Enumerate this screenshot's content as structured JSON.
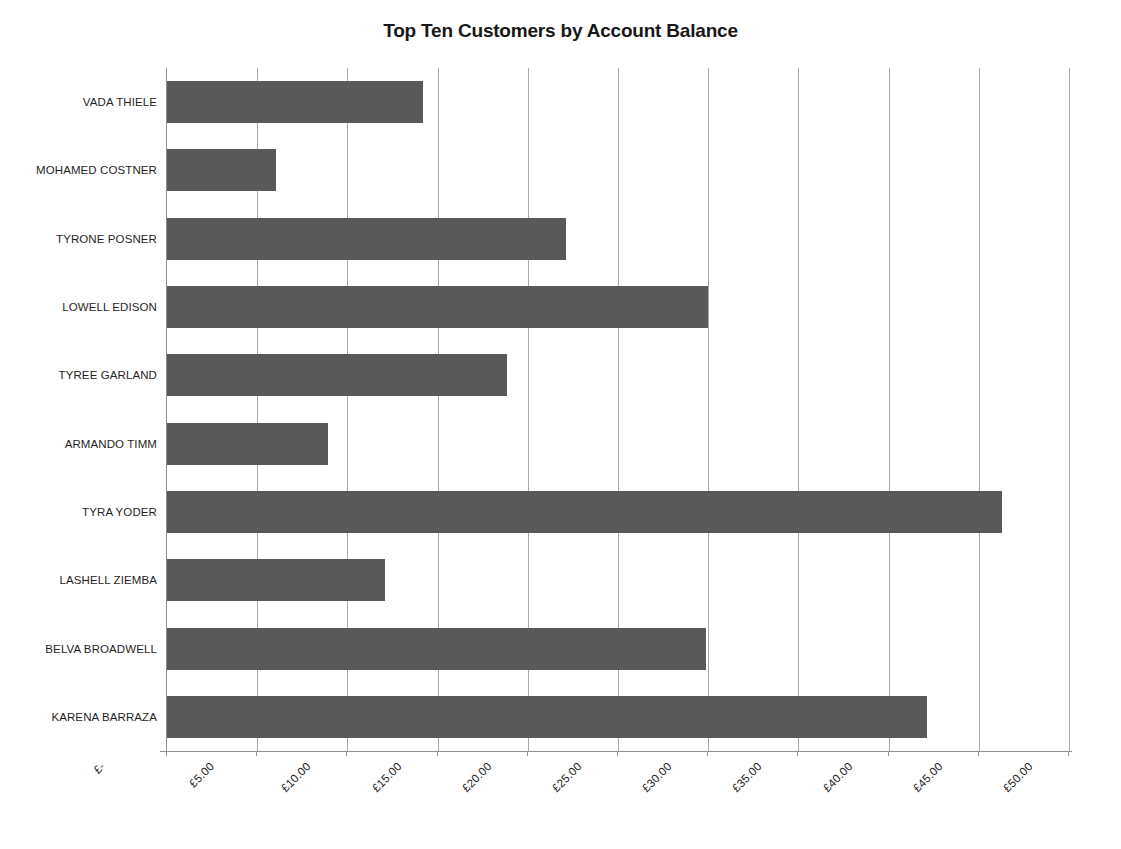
{
  "figure": {
    "caption": ""
  },
  "chart_data": {
    "type": "bar",
    "orientation": "horizontal",
    "title": "Top Ten Customers by Account Balance",
    "xlabel": "",
    "ylabel": "",
    "categories": [
      "VADA THIELE",
      "MOHAMED COSTNER",
      "TYRONE POSNER",
      "LOWELL EDISON",
      "TYREE GARLAND",
      "ARMANDO TIMM",
      "TYRA YODER",
      "LASHELL ZIEMBA",
      "BELVA BROADWELL",
      "KARENA BARRAZA"
    ],
    "values": [
      14.2,
      6.05,
      22.1,
      30.0,
      18.85,
      8.95,
      46.3,
      12.1,
      29.9,
      42.15
    ],
    "xlim": [
      0,
      50
    ],
    "xtick_values": [
      0,
      5,
      10,
      15,
      20,
      25,
      30,
      35,
      40,
      45,
      50
    ],
    "xtick_labels": [
      "£-",
      "£5.00",
      "£10.00",
      "£15.00",
      "£20.00",
      "£25.00",
      "£30.00",
      "£35.00",
      "£40.00",
      "£45.00",
      "£50.00"
    ],
    "bar_color": "#595959",
    "grid": "vertical",
    "gridline_color": "#a8a8a8",
    "legend": "none",
    "currency": "GBP"
  }
}
